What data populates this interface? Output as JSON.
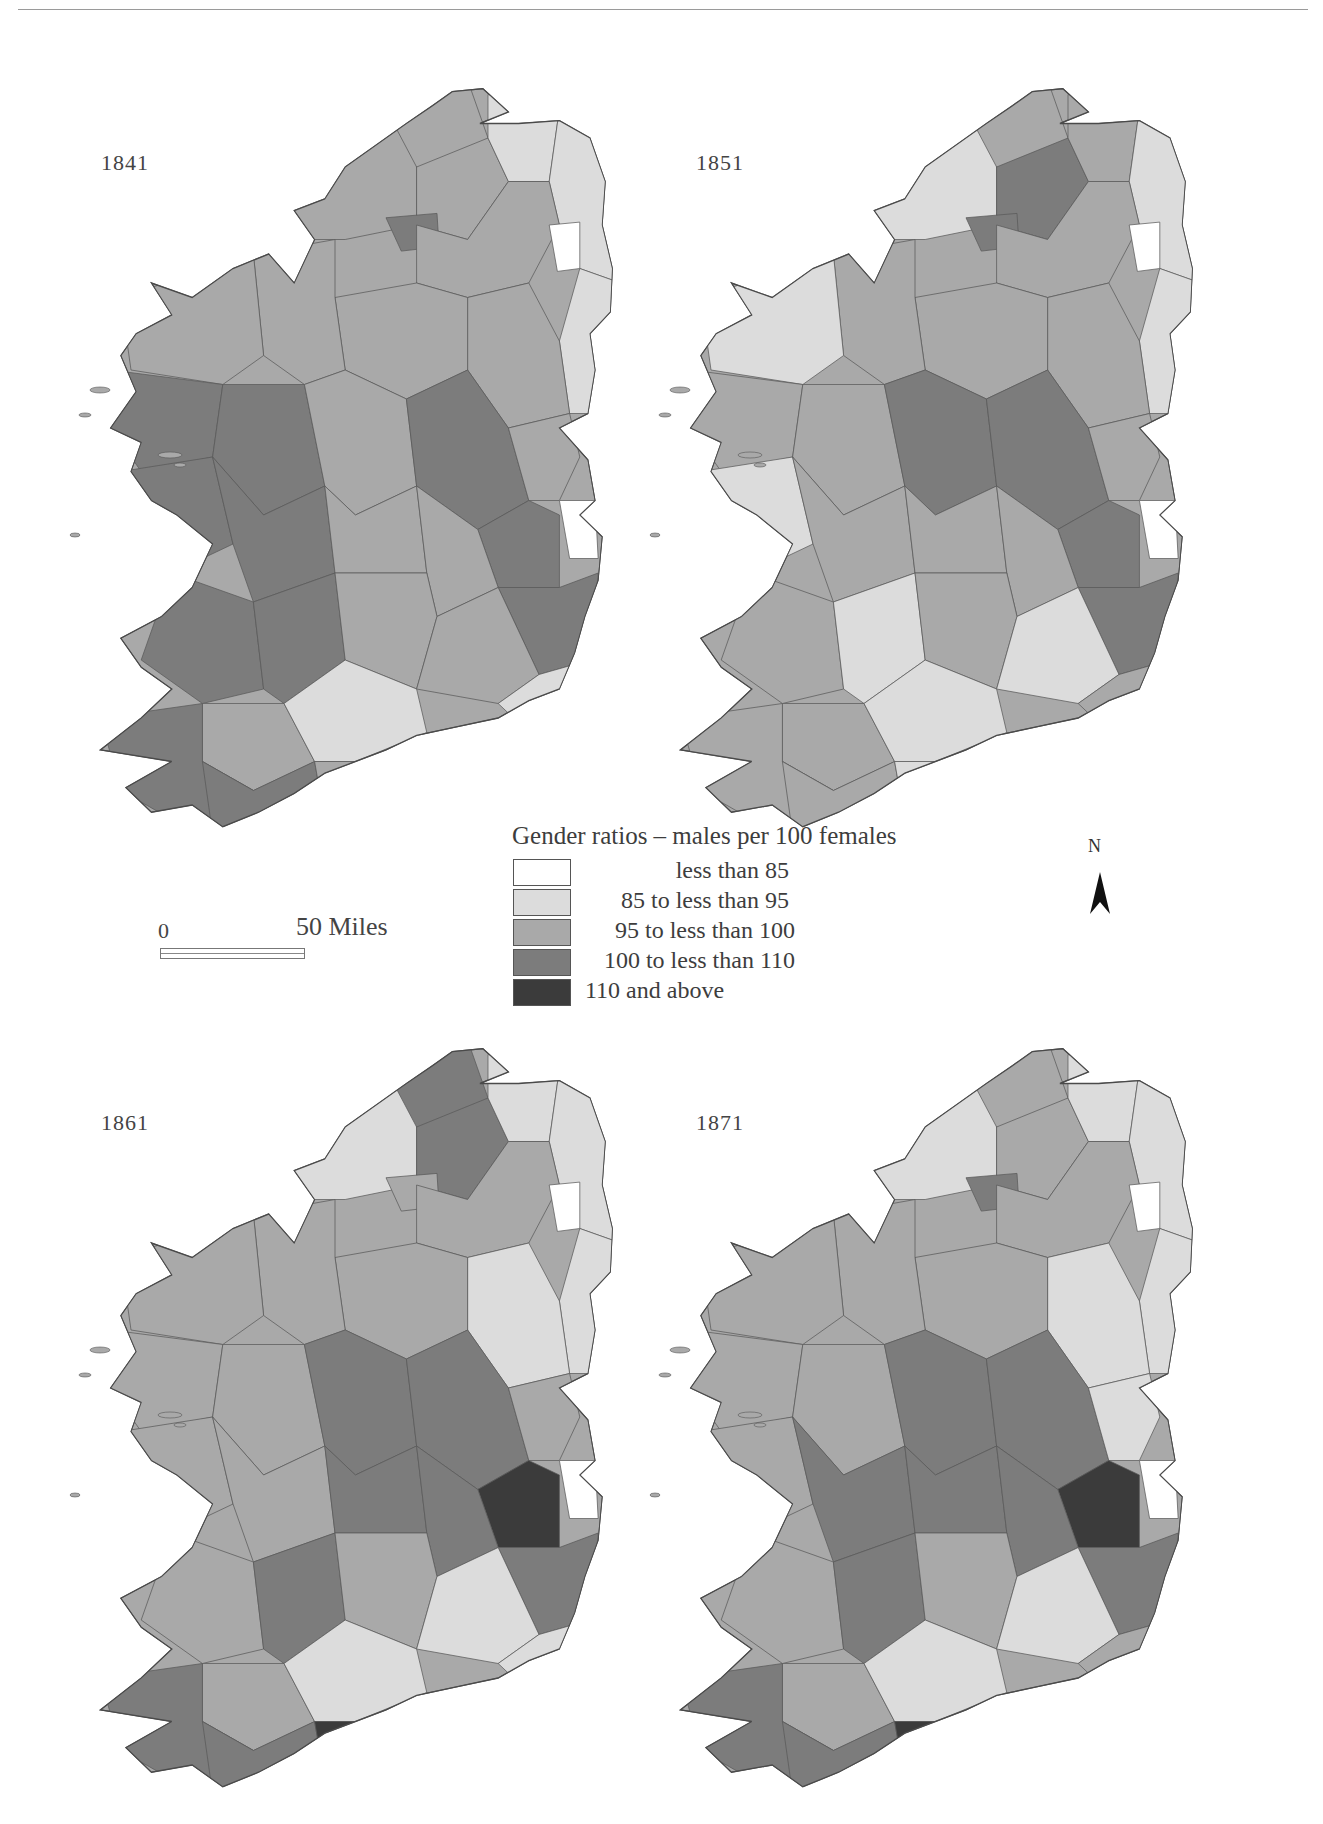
{
  "maps": [
    {
      "year": "1841"
    },
    {
      "year": "1851"
    },
    {
      "year": "1861"
    },
    {
      "year": "1871"
    }
  ],
  "legend": {
    "title": "Gender ratios – males per 100 females",
    "classes": [
      {
        "label": "less than  85",
        "color": "#ffffff"
      },
      {
        "label": "85 to less than  95",
        "color": "#dcdcdc"
      },
      {
        "label": "95 to less than 100",
        "color": "#a9a9a9"
      },
      {
        "label": "100 to less than 110",
        "color": "#7c7c7c"
      },
      {
        "label": "110 and above",
        "color": "#3b3b3b"
      }
    ]
  },
  "scale_bar": {
    "start_label": "0",
    "end_label": "50 Miles"
  },
  "north_arrow": {
    "label": "N"
  },
  "chart_data": {
    "type": "choropleth",
    "title": "Gender ratios – males per 100 females",
    "panels": [
      "1841",
      "1851",
      "1861",
      "1871"
    ],
    "classes": [
      "less than 85",
      "85 to less than 95",
      "95 to less than 100",
      "100 to less than 110",
      "110 and above"
    ],
    "dominant_pattern": {
      "1841": "West (Mayo/Galway/Kerry/Cork west) and east-midlands mostly 100–110; north-east mostly 85–95; remainder 95–100",
      "1851": "Mostly 95–100 and 85–95; east-midlands block 100–110; no 110+ class",
      "1861": "Central midlands 100–110; two small 110+ districts (east near Dublin, south near Cork); north-east and south-east 85–95",
      "1871": "Large central/eastern block 100–110; 110+ district near Dublin and on south Cork coast; north-east and south-east 85–95"
    }
  }
}
